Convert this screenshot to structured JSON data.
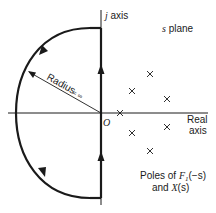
{
  "diagram": {
    "title": "s plane",
    "axes": {
      "imaginary_label_prefix": "j",
      "imaginary_label_suffix": " axis",
      "real_label_line1": "Real",
      "real_label_line2": "axis",
      "origin_label": "O"
    },
    "contour": {
      "description": "Closed contour along j axis and left semicircle",
      "radius_label": "Radius = ∞",
      "radius_text": "Radius",
      "radius_eq": "= ∞",
      "direction": "counterclockwise along j axis upward, then around left semicircle"
    },
    "poles": {
      "caption_line1_prefix": "Poles of ",
      "caption_F": "F",
      "caption_sub": "1",
      "caption_arg": "(−s)",
      "caption_line2_prefix": "and ",
      "caption_X": "X",
      "caption_arg2": "(s)",
      "points": [
        {
          "x": 120,
          "y": 113
        },
        {
          "x": 132,
          "y": 91
        },
        {
          "x": 150,
          "y": 74
        },
        {
          "x": 167,
          "y": 99
        },
        {
          "x": 132,
          "y": 133
        },
        {
          "x": 150,
          "y": 151
        },
        {
          "x": 167,
          "y": 127
        }
      ]
    },
    "colors": {
      "line": "#1a1a1a",
      "background": "#ffffff"
    }
  }
}
